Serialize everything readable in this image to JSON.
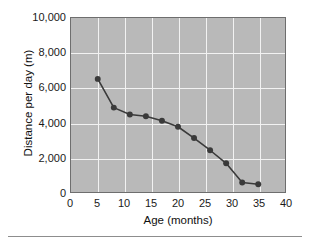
{
  "chart_data": {
    "type": "line",
    "title": "",
    "xlabel": "Age (months)",
    "ylabel": "Distance per day (m)",
    "xlim": [
      0,
      40
    ],
    "ylim": [
      0,
      10000
    ],
    "xticks": [
      0,
      5,
      10,
      15,
      20,
      25,
      30,
      35,
      40
    ],
    "xtick_labels": [
      "0",
      "5",
      "10",
      "15",
      "20",
      "25",
      "30",
      "35",
      "40"
    ],
    "yticks": [
      0,
      2000,
      4000,
      6000,
      8000,
      10000
    ],
    "ytick_labels": [
      "0",
      "2,000",
      "4,000",
      "6,000",
      "8,000",
      "10,000"
    ],
    "grid": true,
    "grid_color": "#f2f2f2",
    "plot_background": "#b9b9b9",
    "legend": null,
    "series": [
      {
        "name": "Distance per day",
        "marker": "circle",
        "color": "#3a3a3a",
        "x": [
          5,
          8,
          11,
          14,
          17,
          20,
          23,
          26,
          29,
          32,
          35
        ],
        "values": [
          6500,
          4850,
          4450,
          4350,
          4100,
          3750,
          3100,
          2400,
          1650,
          550,
          450
        ]
      }
    ]
  },
  "axes": {
    "x_title": "Age (months)",
    "y_title": "Distance per day (m)"
  }
}
